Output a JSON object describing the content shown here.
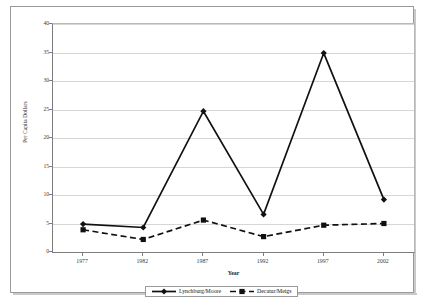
{
  "chart_data": {
    "type": "line",
    "title": "",
    "xlabel": "Year",
    "ylabel": "Per Capita Dollars",
    "categories": [
      "1977",
      "1982",
      "1987",
      "1992",
      "1997",
      "2002"
    ],
    "x": [
      1977,
      1982,
      1987,
      1992,
      1997,
      2002
    ],
    "series": [
      {
        "name": "Lynchburg/Moore",
        "values": [
          4.9,
          4.3,
          24.7,
          6.6,
          34.9,
          9.2
        ],
        "marker": "diamond",
        "line_style": "solid",
        "color": "#111111"
      },
      {
        "name": "Decatur/Meigs",
        "values": [
          3.9,
          2.2,
          5.6,
          2.7,
          4.7,
          5.0
        ],
        "marker": "square",
        "line_style": "dashed",
        "color": "#111111"
      }
    ],
    "ylim": [
      0,
      40
    ],
    "yticks": [
      0,
      5,
      10,
      15,
      20,
      25,
      30,
      35,
      40
    ],
    "ytick_labels": [
      "0",
      "5",
      "10",
      "15",
      "20",
      "25",
      "30",
      "35",
      "40"
    ],
    "grid": true,
    "grid_axis": "y",
    "legend_position": "bottom"
  },
  "axes": {
    "y_title": "Per Capita Dollars",
    "x_title": "Year"
  },
  "legend": {
    "items": [
      {
        "label": "Lynchburg/Moore",
        "marker": "diamond",
        "line_style": "solid"
      },
      {
        "label": "Decatur/Meigs",
        "marker": "square",
        "line_style": "dashed"
      }
    ]
  },
  "colors": {
    "series": "#111111",
    "gridline": "#d6d6d6",
    "axis": "#7d7d7d",
    "frame": "#9a9a9a",
    "background": "#ffffff"
  }
}
